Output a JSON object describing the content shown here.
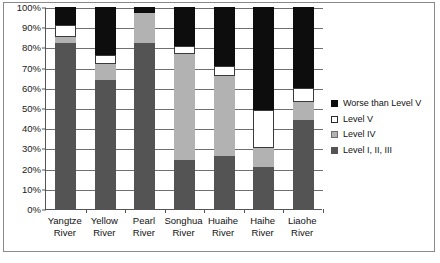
{
  "chart_data": {
    "type": "bar",
    "stacked": true,
    "title": "",
    "subtitle": "",
    "xlabel": "",
    "ylabel": "",
    "ylim": [
      0,
      100
    ],
    "y_tick_labels": [
      "0%",
      "10%",
      "20%",
      "30%",
      "40%",
      "50%",
      "60%",
      "70%",
      "80%",
      "90%",
      "100%"
    ],
    "y_tick_values": [
      0,
      10,
      20,
      30,
      40,
      50,
      60,
      70,
      80,
      90,
      100
    ],
    "grid": "horizontal",
    "legend_position": "right",
    "categories": [
      "Yangtze River",
      "Yellow River",
      "Pearl River",
      "Songhua River",
      "Huaihe River",
      "Haihe River",
      "Liaohe River"
    ],
    "category_lines": [
      [
        "Yangtze",
        "River"
      ],
      [
        "Yellow",
        "River"
      ],
      [
        "Pearl",
        "River"
      ],
      [
        "Songhua",
        "River"
      ],
      [
        "Huaihe",
        "River"
      ],
      [
        "Haihe",
        "River"
      ],
      [
        "Liaohe",
        "River"
      ]
    ],
    "series": [
      {
        "name": "Level I, II, III",
        "color": "#545454",
        "values": [
          82,
          64,
          82,
          24.5,
          26,
          21,
          44
        ]
      },
      {
        "name": "Level IV",
        "color": "#b2b2b2",
        "values": [
          3,
          8,
          15,
          52,
          40,
          9,
          9
        ]
      },
      {
        "name": "Level V",
        "color": "#ffffff",
        "values": [
          6,
          4,
          0,
          4,
          5,
          19,
          7
        ]
      },
      {
        "name": "Worse than Level V",
        "color": "#0d0d0d",
        "values": [
          9,
          24,
          3,
          19.5,
          29,
          51,
          40
        ]
      }
    ],
    "legend_entries": [
      {
        "label": "Worse than Level V",
        "swatch": "worse"
      },
      {
        "label": "Level V",
        "swatch": "lvl5"
      },
      {
        "label": "Level IV",
        "swatch": "lvl4"
      },
      {
        "label": "Level I, II, III",
        "swatch": "lvl123"
      }
    ]
  }
}
